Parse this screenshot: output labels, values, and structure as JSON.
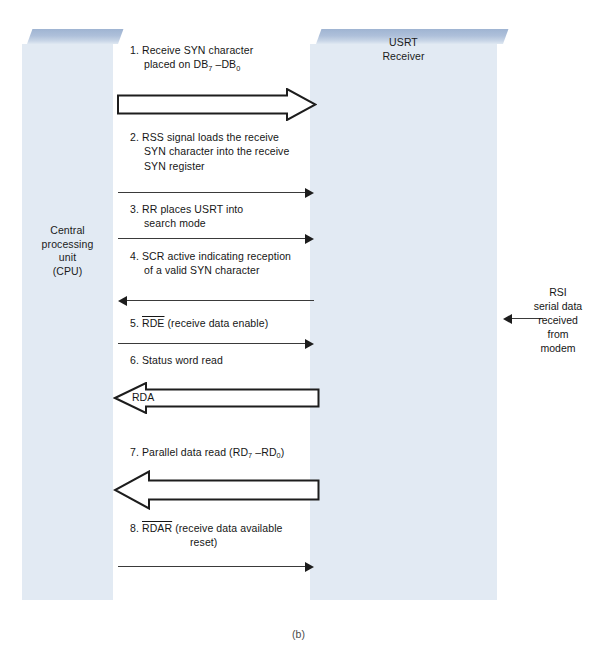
{
  "figure": {
    "caption": "(b)",
    "colors": {
      "block_face": "#e2eaf3",
      "block_top": "#a8bcd8",
      "arrow_stroke": "#1d1d1d",
      "text": "#161616"
    }
  },
  "blocks": {
    "left": {
      "name": "central-processing-unit",
      "lines": [
        "Central",
        "processing",
        "unit",
        "(CPU)"
      ]
    },
    "right": {
      "name": "usrt-receiver",
      "lines": [
        "USRT",
        "Receiver"
      ]
    }
  },
  "side_note": {
    "lines": [
      "RSI",
      "serial data",
      "received",
      "from",
      "modem"
    ],
    "arrow_direction": "left"
  },
  "steps": [
    {
      "id": 1,
      "number": "1.",
      "lines": [
        "Receive SYN character",
        "placed on DB7 –DB0"
      ],
      "line1": "Receive SYN character",
      "line2_pre": "placed on DB",
      "line2_sub1": "7",
      "line2_mid": " –DB",
      "line2_sub2": "0",
      "overline": null
    },
    {
      "id": 2,
      "number": "2.",
      "line1": "RSS signal loads the receive",
      "line2": "SYN character into the receive",
      "line3": "SYN register"
    },
    {
      "id": 3,
      "number": "3.",
      "line1": "RR places USRT into",
      "line2": "search mode"
    },
    {
      "id": 4,
      "number": "4.",
      "line1": "SCR active indicating reception",
      "line2": "of a valid SYN character"
    },
    {
      "id": 5,
      "number": "5.",
      "overlined": "RDE",
      "rest": " (receive data enable)"
    },
    {
      "id": 6,
      "number": "6.",
      "line1": "Status word read"
    },
    {
      "id": 7,
      "number": "7.",
      "pre": "Parallel data read (RD",
      "sub1": "7",
      "mid": " –RD",
      "sub2": "0",
      "post": ")"
    },
    {
      "id": 8,
      "number": "8.",
      "overlined": "RDAR",
      "rest": " (receive data available",
      "line2": "reset)"
    }
  ],
  "arrows": {
    "block_arrow_1": {
      "label": "",
      "direction": "right"
    },
    "thin_arrow_2": {
      "direction": "right"
    },
    "thin_arrow_3": {
      "direction": "right"
    },
    "thin_arrow_4": {
      "direction": "left"
    },
    "thin_arrow_5": {
      "direction": "right"
    },
    "block_arrow_rda": {
      "label": "RDA",
      "direction": "left"
    },
    "block_arrow_7": {
      "label": "",
      "direction": "left"
    },
    "thin_arrow_8": {
      "direction": "right"
    }
  }
}
